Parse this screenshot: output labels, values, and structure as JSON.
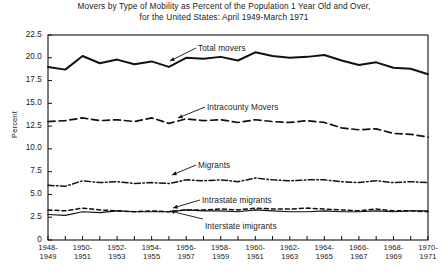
{
  "chart_data": {
    "type": "line",
    "title": "Movers by Type of Mobility as Percent of the Population 1 Year Old and Over,",
    "subtitle": "for the United States: April 1949-March 1971",
    "xlabel": "",
    "ylabel": "Percent",
    "ylim": [
      0,
      22.5
    ],
    "yticks": [
      "0",
      "2.5",
      "5.0",
      "7.5",
      "10.0",
      "12.5",
      "15.0",
      "17.5",
      "20.0",
      "22.5"
    ],
    "ytick_values": [
      0,
      2.5,
      5.0,
      7.5,
      10.0,
      12.5,
      15.0,
      17.5,
      20.0,
      22.5
    ],
    "grid": false,
    "legend_position": "inline-annotations",
    "categories": [
      "1948-1949",
      "1949-1950",
      "1950-1951",
      "1951-1952",
      "1952-1953",
      "1953-1954",
      "1954-1955",
      "1955-1956",
      "1956-1957",
      "1957-1958",
      "1958-1959",
      "1959-1960",
      "1960-1961",
      "1961-1962",
      "1962-1963",
      "1963-1964",
      "1964-1965",
      "1965-1966",
      "1966-1967",
      "1967-1968",
      "1968-1969",
      "1969-1970",
      "1970-1971"
    ],
    "xtick_labels": [
      {
        "top": "1948-",
        "bottom": "1949"
      },
      {
        "top": "1950-",
        "bottom": "1951"
      },
      {
        "top": "1952-",
        "bottom": "1953"
      },
      {
        "top": "1954-",
        "bottom": "1955"
      },
      {
        "top": "1956-",
        "bottom": "1957"
      },
      {
        "top": "1958-",
        "bottom": "1959"
      },
      {
        "top": "1960-",
        "bottom": "1961"
      },
      {
        "top": "1962-",
        "bottom": "1963"
      },
      {
        "top": "1964-",
        "bottom": "1965"
      },
      {
        "top": "1966-",
        "bottom": "1967"
      },
      {
        "top": "1968-",
        "bottom": "1969"
      },
      {
        "top": "1970-",
        "bottom": "1971"
      }
    ],
    "series": [
      {
        "name": "Total movers",
        "style": "solid",
        "color": "#111111",
        "width": 2.0,
        "values": [
          19.0,
          18.7,
          20.2,
          19.4,
          19.8,
          19.3,
          19.6,
          19.0,
          20.0,
          19.9,
          20.1,
          19.7,
          20.6,
          20.2,
          20.0,
          20.1,
          20.3,
          19.7,
          19.2,
          19.5,
          18.9,
          18.8,
          18.2
        ]
      },
      {
        "name": "Intracounty Movers",
        "style": "dashed",
        "color": "#111111",
        "width": 1.7,
        "values": [
          13.0,
          13.1,
          13.4,
          13.1,
          13.2,
          13.0,
          13.4,
          12.8,
          13.3,
          13.1,
          13.2,
          12.9,
          13.2,
          13.0,
          12.9,
          13.1,
          12.9,
          12.3,
          12.1,
          12.2,
          11.7,
          11.6,
          11.3
        ]
      },
      {
        "name": "Migrants",
        "style": "dashdot",
        "color": "#111111",
        "width": 1.5,
        "values": [
          6.0,
          5.9,
          6.5,
          6.3,
          6.4,
          6.2,
          6.3,
          6.2,
          6.6,
          6.5,
          6.6,
          6.4,
          6.8,
          6.6,
          6.5,
          6.6,
          6.6,
          6.4,
          6.3,
          6.5,
          6.3,
          6.4,
          6.3
        ]
      },
      {
        "name": "Intrastate migrants",
        "style": "shortdash",
        "color": "#111111",
        "width": 1.5,
        "values": [
          3.3,
          3.2,
          3.5,
          3.3,
          3.2,
          3.1,
          3.2,
          3.1,
          3.3,
          3.3,
          3.4,
          3.3,
          3.5,
          3.4,
          3.4,
          3.5,
          3.4,
          3.3,
          3.2,
          3.4,
          3.2,
          3.2,
          3.1
        ]
      },
      {
        "name": "Interstate imigrants",
        "style": "solid-thin",
        "color": "#111111",
        "width": 1.2,
        "values": [
          2.8,
          2.7,
          3.1,
          3.0,
          3.2,
          3.1,
          3.1,
          3.1,
          3.3,
          3.2,
          3.2,
          3.1,
          3.3,
          3.2,
          3.1,
          3.1,
          3.2,
          3.1,
          3.1,
          3.2,
          3.1,
          3.2,
          3.2
        ]
      }
    ],
    "annotations": [
      {
        "label": "Total movers",
        "x": 198,
        "y": 44
      },
      {
        "label": "Intracounty Movers",
        "x": 207,
        "y": 103
      },
      {
        "label": "Migrants",
        "x": 198,
        "y": 161
      },
      {
        "label": "Intrastate migrants",
        "x": 202,
        "y": 196
      },
      {
        "label": "Interstate imigrants",
        "x": 205,
        "y": 222
      }
    ]
  }
}
